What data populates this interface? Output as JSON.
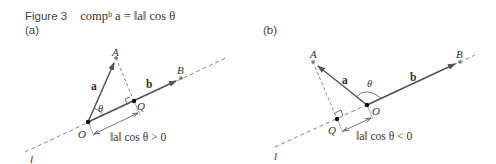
{
  "caption": {
    "figure_label": "Figure 3",
    "formula": "compᵇ a = ‖a‖ cos θ"
  },
  "panels": [
    {
      "label": "(a)",
      "points": {
        "O": "O",
        "A": "A",
        "Q": "Q",
        "B": "B"
      },
      "vectors": {
        "a": "a",
        "b": "b"
      },
      "angle": "θ",
      "line": "l",
      "measure": "‖a‖ cos θ > 0"
    },
    {
      "label": "(b)",
      "points": {
        "O": "O",
        "A": "A",
        "Q": "Q",
        "B": "B"
      },
      "vectors": {
        "a": "a",
        "b": "b"
      },
      "angle": "θ",
      "line": "l",
      "measure": "‖a‖ cos θ < 0"
    }
  ],
  "colors": {
    "vector": "#555555",
    "dashed": "#666666",
    "point": "#111111",
    "gray_point": "#777777"
  }
}
